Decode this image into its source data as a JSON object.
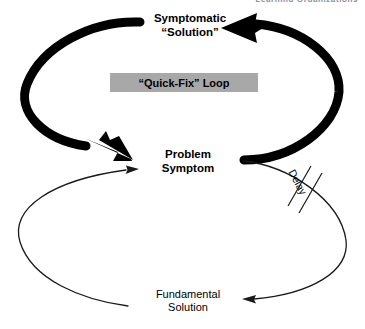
{
  "page": {
    "header_sliver_text": "Learning Organizations",
    "background_color": "#ffffff",
    "ink_color": "#000000"
  },
  "diagram": {
    "nodes": [
      {
        "id": "symptomatic-solution",
        "line1": "Symptomatic",
        "line2": "“Solution”",
        "text": "Symptomatic\n“Solution”",
        "weight": "bold"
      },
      {
        "id": "problem-symptom",
        "line1": "Problem",
        "line2": "Symptom",
        "text": "Problem\nSymptom",
        "weight": "bold"
      },
      {
        "id": "fundamental-solution",
        "line1": "Fundamental",
        "line2": "Solution",
        "text": "Fundamental\nSolution",
        "weight": "normal"
      }
    ],
    "loop_label": {
      "id": "quick-fix-loop",
      "text": "“Quick-Fix” Loop",
      "box_color": "#a8a8a8",
      "text_color": "#000000"
    },
    "delay_marker": {
      "id": "delay",
      "text": "Delay",
      "hash_marks": 2
    },
    "links": [
      {
        "id": "symptomatic-to-problem",
        "from": "symptomatic-solution",
        "to": "problem-symptom",
        "style": "thick",
        "side": "left"
      },
      {
        "id": "problem-to-symptomatic",
        "from": "problem-symptom",
        "to": "symptomatic-solution",
        "style": "thick",
        "side": "right"
      },
      {
        "id": "fundamental-to-problem",
        "from": "fundamental-solution",
        "to": "problem-symptom",
        "style": "thin",
        "side": "left"
      },
      {
        "id": "problem-to-fundamental",
        "from": "problem-symptom",
        "to": "fundamental-solution",
        "style": "thin",
        "side": "right",
        "marker": "delay"
      }
    ]
  }
}
